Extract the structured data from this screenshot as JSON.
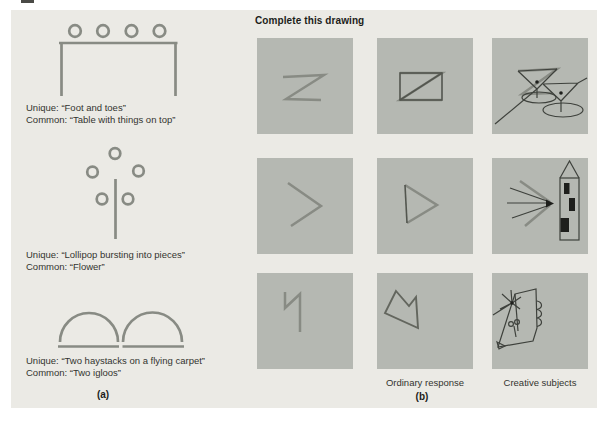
{
  "figure": {
    "panel_a": {
      "label": "(a)",
      "captions": [
        {
          "unique": "Unique: “Foot and toes”",
          "common": "Common: “Table with things on top”"
        },
        {
          "unique": "Unique: “Lollipop bursting into pieces”",
          "common": "Common: “Flower”"
        },
        {
          "unique": "Unique: “Two haystacks on a flying carpet”",
          "common": "Common: “Two igloos”"
        }
      ]
    },
    "panel_b": {
      "label": "(b)",
      "title": "Complete this drawing",
      "ordinary_label": "Ordinary response",
      "creative_label": "Creative subjects"
    },
    "colors": {
      "panel_bg": "#ebeae5",
      "square_bg": "#b5b8b2",
      "stimulus_gray": "#888b84",
      "ink_dark": "#53564f",
      "ink_thin": "#3e413c",
      "ink_black": "#1e1f1c",
      "text": "#33342f"
    }
  }
}
